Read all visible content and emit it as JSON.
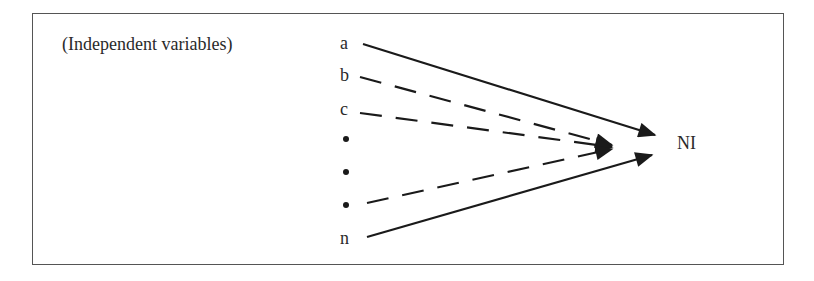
{
  "diagram": {
    "heading": "(Independent variables)",
    "variables": [
      {
        "label": "a",
        "line_style": "solid"
      },
      {
        "label": "b",
        "line_style": "dashed"
      },
      {
        "label": "c",
        "line_style": "dashed"
      },
      {
        "label": "•",
        "line_style": "none"
      },
      {
        "label": "•",
        "line_style": "none"
      },
      {
        "label": "•",
        "line_style": "dashed"
      },
      {
        "label": "n",
        "line_style": "solid"
      }
    ],
    "target": "NI",
    "colors": {
      "line": "#1a1a1a",
      "border": "#555555",
      "text": "#2a2a2a"
    }
  }
}
